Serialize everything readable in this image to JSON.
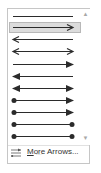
{
  "gallery": {
    "title": "Arrows gallery",
    "selected_index": 1,
    "items": [
      {
        "name": "line-plain",
        "start": "none",
        "end": "none"
      },
      {
        "name": "arrow-right-open",
        "start": "none",
        "end": "open"
      },
      {
        "name": "arrow-left-open",
        "start": "open",
        "end": "none"
      },
      {
        "name": "arrow-double-open",
        "start": "open",
        "end": "open"
      },
      {
        "name": "arrow-right-solid",
        "start": "none",
        "end": "solid"
      },
      {
        "name": "arrow-left-solid",
        "start": "solid",
        "end": "none"
      },
      {
        "name": "arrow-double-solid",
        "start": "solid",
        "end": "solid"
      },
      {
        "name": "dot-arrow-solid",
        "start": "dot",
        "end": "solid"
      },
      {
        "name": "dot-arrow-solid-2",
        "start": "dot",
        "end": "solid"
      },
      {
        "name": "dot-dot",
        "start": "dot",
        "end": "dot"
      },
      {
        "name": "dot-dot-2",
        "start": "dot",
        "end": "dot"
      }
    ]
  },
  "footer": {
    "more_arrows_accel": "M",
    "more_arrows_rest": "ore Arrows...",
    "icon": "arrow-options-icon"
  },
  "scrollbar": {
    "up": "▲",
    "down": "▼"
  },
  "grip": "....",
  "colors": {
    "line": "#2b2b2b",
    "selected_bg": "#dcdcdc",
    "selected_border": "#b8b8b8",
    "border": "#c6c6c6"
  }
}
